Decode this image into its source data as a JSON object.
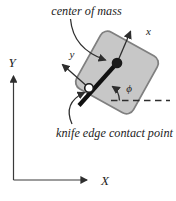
{
  "figure": {
    "background": "#ffffff",
    "plate": {
      "fill": "#c7c7c7",
      "stroke": "#808080"
    },
    "ink_color": "#2e2e2e",
    "labels": {
      "center_of_mass": "center of mass",
      "knife_edge": "knife edge contact point",
      "body_x": "x",
      "body_y": "y",
      "phi": "ϕ",
      "world_x": "X",
      "world_y": "Y"
    }
  }
}
